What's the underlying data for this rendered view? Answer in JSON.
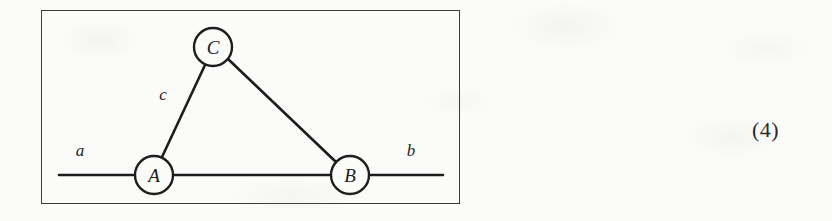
{
  "figure": {
    "type": "graph-diagram",
    "frame": {
      "border_color": "#3c3c3c"
    },
    "background_color": "#fbfbf9",
    "ink_color": "#1d1d1d",
    "nodes": [
      {
        "id": "A",
        "label": "A",
        "cx": 113,
        "cy": 165,
        "r": 19
      },
      {
        "id": "B",
        "label": "B",
        "cx": 309,
        "cy": 165,
        "r": 19
      },
      {
        "id": "C",
        "label": "C",
        "cx": 172,
        "cy": 37,
        "r": 19
      }
    ],
    "edges": [
      {
        "id": "AC",
        "label": "c",
        "from": "A",
        "to": "C"
      },
      {
        "id": "CB",
        "label": "",
        "from": "C",
        "to": "B"
      },
      {
        "id": "AB",
        "label": "",
        "from": "A",
        "to": "B"
      }
    ],
    "terminals": [
      {
        "id": "a",
        "label": "a",
        "side": "left",
        "x1": 18,
        "y1": 165,
        "x2": 94,
        "y2": 165
      },
      {
        "id": "b",
        "label": "b",
        "side": "right",
        "x1": 328,
        "y1": 165,
        "x2": 402,
        "y2": 165
      }
    ],
    "edge_labels": [
      {
        "id": "c",
        "label": "c",
        "x": 122,
        "y": 90
      }
    ],
    "terminal_labels": [
      {
        "id": "a",
        "label": "a",
        "x": 39,
        "y": 146
      },
      {
        "id": "b",
        "label": "b",
        "x": 370,
        "y": 146
      }
    ]
  },
  "equation_number": "(4)"
}
